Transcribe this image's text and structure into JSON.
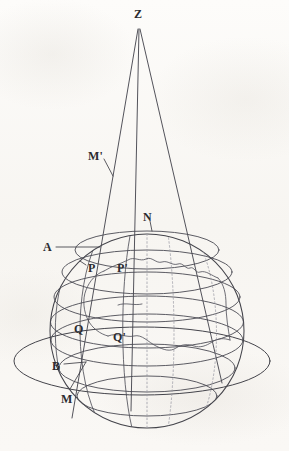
{
  "figure": {
    "kind": "geometric-projection-diagram",
    "background_color": "#fbfaf8",
    "ink_color": "#3a3a40",
    "faint_ink_color": "#8d8d95"
  },
  "labels": [
    {
      "id": "Z",
      "text": "Z",
      "x": 134,
      "y": 8,
      "size": 12
    },
    {
      "id": "M'",
      "text": "M'",
      "x": 88,
      "y": 150,
      "size": 12
    },
    {
      "id": "N",
      "text": "N",
      "x": 143,
      "y": 211,
      "size": 12
    },
    {
      "id": "A",
      "text": "A",
      "x": 43,
      "y": 241,
      "size": 12
    },
    {
      "id": "P",
      "text": "P",
      "x": 88,
      "y": 262,
      "size": 12
    },
    {
      "id": "P'",
      "text": "P'",
      "x": 117,
      "y": 262,
      "size": 12
    },
    {
      "id": "Q",
      "text": "Q",
      "x": 74,
      "y": 323,
      "size": 12
    },
    {
      "id": "Q'",
      "text": "Q'",
      "x": 113,
      "y": 331,
      "size": 12
    },
    {
      "id": "B",
      "text": "B",
      "x": 52,
      "y": 360,
      "size": 12
    },
    {
      "id": "M",
      "text": "M",
      "x": 61,
      "y": 393,
      "size": 12
    }
  ],
  "geometry": {
    "apex": {
      "x": 138,
      "y": 28
    },
    "sphere": {
      "cx": 147,
      "cy": 331,
      "r": 97
    },
    "equator_ring": {
      "cx": 142,
      "cy": 361,
      "rx": 129,
      "ry": 34
    },
    "rays": [
      {
        "name": "ray-left-M",
        "x2": 72,
        "y2": 418
      },
      {
        "name": "ray-mid",
        "x2": 131,
        "y2": 411
      },
      {
        "name": "ray-right",
        "x2": 222,
        "y2": 383
      }
    ],
    "latitude_circles": [
      {
        "name": "lat-A",
        "cy": 250,
        "rx": 72,
        "ry": 19
      },
      {
        "name": "lat-P",
        "cy": 271,
        "rx": 86,
        "ry": 22
      },
      {
        "name": "lat-mid",
        "cy": 296,
        "rx": 94,
        "ry": 25
      },
      {
        "name": "lat-Q",
        "cy": 322,
        "rx": 97,
        "ry": 26
      },
      {
        "name": "lat-Qb",
        "cy": 338,
        "rx": 96,
        "ry": 26
      },
      {
        "name": "lat-B",
        "cy": 366,
        "rx": 89,
        "ry": 24
      },
      {
        "name": "lat-low",
        "cy": 392,
        "rx": 74,
        "ry": 21
      }
    ]
  }
}
